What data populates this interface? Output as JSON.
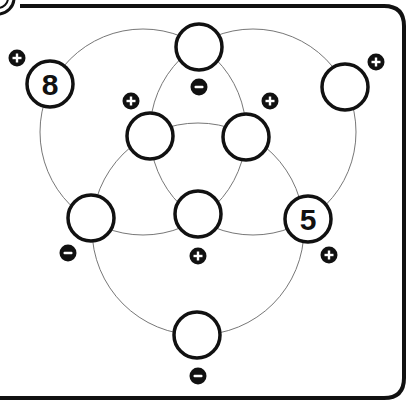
{
  "puzzle": {
    "type": "three-circle number puzzle",
    "frame": {
      "stroke": "#111111",
      "background": "#ffffff"
    },
    "venn_circles": [
      {
        "id": "left",
        "cx": 143,
        "cy": 132,
        "r": 103
      },
      {
        "id": "right",
        "cx": 253,
        "cy": 132,
        "r": 103
      },
      {
        "id": "bottom",
        "cx": 198,
        "cy": 229,
        "r": 106
      }
    ],
    "nodes": [
      {
        "id": "top",
        "cx": 199,
        "cy": 47,
        "value": ""
      },
      {
        "id": "top-left",
        "cx": 50,
        "cy": 84,
        "value": "8"
      },
      {
        "id": "top-right",
        "cx": 345,
        "cy": 87,
        "value": ""
      },
      {
        "id": "mid-left",
        "cx": 150,
        "cy": 136,
        "value": ""
      },
      {
        "id": "mid-right",
        "cx": 246,
        "cy": 137,
        "value": ""
      },
      {
        "id": "lower-left",
        "cx": 91,
        "cy": 218,
        "value": ""
      },
      {
        "id": "center",
        "cx": 198,
        "cy": 214,
        "value": ""
      },
      {
        "id": "lower-right",
        "cx": 308,
        "cy": 219,
        "value": "5"
      },
      {
        "id": "bottom",
        "cx": 197,
        "cy": 335,
        "value": ""
      }
    ],
    "signs": [
      {
        "id": "sign-top-left",
        "cx": 17,
        "cy": 58,
        "symbol": "+"
      },
      {
        "id": "sign-top",
        "cx": 199,
        "cy": 87,
        "symbol": "−"
      },
      {
        "id": "sign-top-right",
        "cx": 376,
        "cy": 62,
        "symbol": "+"
      },
      {
        "id": "sign-mid-left",
        "cx": 131,
        "cy": 101,
        "symbol": "+"
      },
      {
        "id": "sign-mid-right",
        "cx": 270,
        "cy": 101,
        "symbol": "+"
      },
      {
        "id": "sign-lower-left",
        "cx": 68,
        "cy": 253,
        "symbol": "−"
      },
      {
        "id": "sign-center",
        "cx": 198,
        "cy": 256,
        "symbol": "+"
      },
      {
        "id": "sign-lower-right",
        "cx": 329,
        "cy": 255,
        "symbol": "+"
      },
      {
        "id": "sign-bottom",
        "cx": 198,
        "cy": 376,
        "symbol": "−"
      }
    ]
  }
}
